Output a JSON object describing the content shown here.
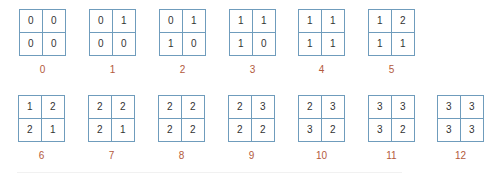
{
  "colors": {
    "grid_line": "#6f9cbc",
    "cell_text": "#333333",
    "label_text": "#b35a3c"
  },
  "rows": [
    {
      "items": [
        {
          "label": "0",
          "cells": [
            "0",
            "0",
            "0",
            "0"
          ]
        },
        {
          "label": "1",
          "cells": [
            "0",
            "1",
            "0",
            "0"
          ]
        },
        {
          "label": "2",
          "cells": [
            "0",
            "1",
            "1",
            "0"
          ]
        },
        {
          "label": "3",
          "cells": [
            "1",
            "1",
            "1",
            "0"
          ]
        },
        {
          "label": "4",
          "cells": [
            "1",
            "1",
            "1",
            "1"
          ]
        },
        {
          "label": "5",
          "cells": [
            "1",
            "2",
            "1",
            "1"
          ]
        }
      ]
    },
    {
      "items": [
        {
          "label": "6",
          "cells": [
            "1",
            "2",
            "2",
            "1"
          ]
        },
        {
          "label": "7",
          "cells": [
            "2",
            "2",
            "2",
            "1"
          ]
        },
        {
          "label": "8",
          "cells": [
            "2",
            "2",
            "2",
            "2"
          ]
        },
        {
          "label": "9",
          "cells": [
            "2",
            "3",
            "2",
            "2"
          ]
        },
        {
          "label": "10",
          "cells": [
            "2",
            "3",
            "3",
            "2"
          ]
        },
        {
          "label": "11",
          "cells": [
            "3",
            "3",
            "3",
            "2"
          ]
        },
        {
          "label": "12",
          "cells": [
            "3",
            "3",
            "3",
            "3"
          ]
        }
      ]
    }
  ]
}
